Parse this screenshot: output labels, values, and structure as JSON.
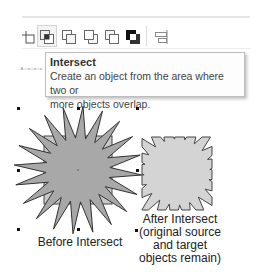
{
  "toolbar": {
    "buttons": [
      {
        "name": "trim",
        "icon": "trim-icon"
      },
      {
        "name": "intersect",
        "icon": "intersect-icon",
        "active": true
      },
      {
        "name": "simplify",
        "icon": "simplify-icon"
      },
      {
        "name": "front-minus-back",
        "icon": "front-minus-back-icon"
      },
      {
        "name": "back-minus-front",
        "icon": "back-minus-front-icon"
      },
      {
        "name": "create-boundary",
        "icon": "boundary-icon"
      },
      {
        "name": "align-distribute",
        "icon": "align-icon"
      }
    ]
  },
  "tooltip": {
    "title": "Intersect",
    "description_line1": "Create an object from the area where two or",
    "description_line2": "more objects overlap."
  },
  "illustration": {
    "before_label": "Before Intersect",
    "after_label_lines": [
      "After Intersect",
      "(original source",
      "and target",
      "objects remain)"
    ],
    "colors": {
      "star_fill": "#a8a8a8",
      "square_fill": "#c8c8c8",
      "result_fill": "#d2d2d2",
      "outline": "#444444"
    }
  }
}
